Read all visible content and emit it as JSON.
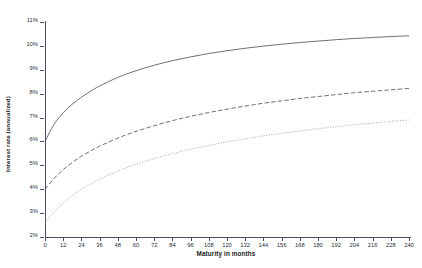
{
  "chart_data": {
    "type": "line",
    "title": "",
    "xlabel": "Maturity in months",
    "ylabel": "Interest rate (annualized)",
    "xlim": [
      0,
      240
    ],
    "ylim": [
      2,
      11
    ],
    "grid": false,
    "legend": "none",
    "x_ticks": [
      0,
      12,
      24,
      36,
      48,
      60,
      72,
      84,
      96,
      108,
      120,
      132,
      144,
      156,
      168,
      180,
      192,
      204,
      216,
      228,
      240
    ],
    "x_tick_labels": [
      "0",
      "12",
      "24",
      "36",
      "48",
      "60",
      "72",
      "84",
      "96",
      "108",
      "120",
      "132",
      "144",
      "156",
      "168",
      "180",
      "192",
      "204",
      "216",
      "228",
      "240"
    ],
    "y_ticks": [
      2,
      3,
      4,
      5,
      6,
      7,
      8,
      9,
      10,
      11
    ],
    "y_tick_labels": [
      "2%",
      "3%",
      "4%",
      "5%",
      "6%",
      "7%",
      "8%",
      "9%",
      "10%",
      "11%"
    ],
    "x": [
      0,
      6,
      12,
      18,
      24,
      30,
      36,
      48,
      60,
      72,
      84,
      96,
      108,
      120,
      132,
      144,
      156,
      168,
      180,
      192,
      204,
      216,
      228,
      240
    ],
    "series": [
      {
        "name": "upper-curve",
        "style": "solid",
        "color": "#555566",
        "values": [
          6.0,
          6.72,
          7.2,
          7.56,
          7.85,
          8.1,
          8.32,
          8.68,
          8.96,
          9.19,
          9.38,
          9.54,
          9.68,
          9.8,
          9.9,
          9.99,
          10.07,
          10.14,
          10.2,
          10.26,
          10.31,
          10.35,
          10.39,
          10.42
        ]
      },
      {
        "name": "middle-curve",
        "style": "dashed",
        "color": "#555566",
        "values": [
          4.0,
          4.45,
          4.82,
          5.12,
          5.38,
          5.6,
          5.8,
          6.14,
          6.42,
          6.66,
          6.87,
          7.05,
          7.21,
          7.35,
          7.48,
          7.6,
          7.7,
          7.8,
          7.88,
          7.96,
          8.04,
          8.1,
          8.16,
          8.22
        ]
      },
      {
        "name": "lower-curve",
        "style": "dotted",
        "color": "#9a9aa8",
        "values": [
          2.6,
          3.05,
          3.42,
          3.73,
          4.0,
          4.22,
          4.42,
          4.76,
          5.04,
          5.28,
          5.49,
          5.67,
          5.83,
          5.98,
          6.11,
          6.23,
          6.34,
          6.44,
          6.53,
          6.62,
          6.7,
          6.77,
          6.84,
          6.9
        ]
      }
    ]
  },
  "colors": {
    "axis": "#4d4d6a",
    "text": "#2b2b3d",
    "background": "#ffffff"
  }
}
